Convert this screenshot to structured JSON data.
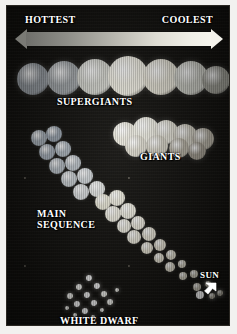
{
  "figure": {
    "title_alt": "Hertzsprung-Russell diagram",
    "background_color": "#13120f",
    "frame_color": "#f2f1ef"
  },
  "axis": {
    "left_label": "HOTTEST",
    "right_label": "COOLEST",
    "arrow": {
      "name": "temperature-gradient-arrow",
      "direction": "double",
      "gradient_from": "#6f6f6b",
      "gradient_to": "#f6f5ee"
    }
  },
  "regions": [
    {
      "key": "supergiants",
      "label": "SUPERGIANTS"
    },
    {
      "key": "giants",
      "label": "GIANTS"
    },
    {
      "key": "main_sequence",
      "label": "MAIN\nSEQUENCE"
    },
    {
      "key": "main_sequence_l1",
      "label": "MAIN"
    },
    {
      "key": "main_sequence_l2",
      "label": "SEQUENCE"
    },
    {
      "key": "sun",
      "label": "SUN"
    },
    {
      "key": "white_dwarf",
      "label": "WHITE DWARF"
    }
  ],
  "labels": {
    "hottest": "HOTTEST",
    "coolest": "COOLEST",
    "supergiants": "SUPERGIANTS",
    "giants": "GIANTS",
    "main_sequence_line1": "MAIN",
    "main_sequence_line2": "SEQUENCE",
    "sun": "SUN",
    "white_dwarf": "WHITE DWARF"
  },
  "chart_data": {
    "type": "scatter",
    "xlabel": "Temperature (HOTTEST to COOLEST)",
    "ylabel": "Luminosity (brightest at top)",
    "xlim_labels": [
      "HOTTEST",
      "COOLEST"
    ],
    "grid": false,
    "legend": "none",
    "annotations": [
      "HOTTEST",
      "COOLEST",
      "SUPERGIANTS",
      "GIANTS",
      "MAIN SEQUENCE",
      "SUN",
      "WHITE DWARF"
    ],
    "groups": [
      {
        "name": "SUPERGIANTS",
        "note": "horizontal band of very large stars across the top",
        "stars": [
          {
            "x": 26,
            "y": 73,
            "r": 16,
            "color": "#9aa0a6"
          },
          {
            "x": 57,
            "y": 72,
            "r": 17,
            "color": "#a8adb0"
          },
          {
            "x": 88,
            "y": 71,
            "r": 18,
            "color": "#d8d9d2"
          },
          {
            "x": 121,
            "y": 70,
            "r": 20,
            "color": "#f1efe4"
          },
          {
            "x": 154,
            "y": 71,
            "r": 18,
            "color": "#e6e3d6"
          },
          {
            "x": 184,
            "y": 72,
            "r": 17,
            "color": "#cfd0c8"
          },
          {
            "x": 209,
            "y": 74,
            "r": 14,
            "color": "#a5a59c"
          }
        ]
      },
      {
        "name": "GIANTS",
        "note": "cluster of medium-large stars, right of centre",
        "stars": [
          {
            "x": 118,
            "y": 128,
            "r": 12,
            "color": "#e9e7dc"
          },
          {
            "x": 139,
            "y": 124,
            "r": 13,
            "color": "#efeee3"
          },
          {
            "x": 159,
            "y": 126,
            "r": 12,
            "color": "#e2e0d4"
          },
          {
            "x": 178,
            "y": 130,
            "r": 12,
            "color": "#cfccbf"
          },
          {
            "x": 196,
            "y": 133,
            "r": 11,
            "color": "#b8b3a6"
          },
          {
            "x": 129,
            "y": 140,
            "r": 11,
            "color": "#dcd9cd"
          },
          {
            "x": 150,
            "y": 140,
            "r": 11,
            "color": "#d4d1c4"
          },
          {
            "x": 172,
            "y": 142,
            "r": 10,
            "color": "#b9b4a6"
          },
          {
            "x": 190,
            "y": 145,
            "r": 9,
            "color": "#a49e92"
          }
        ]
      },
      {
        "name": "MAIN SEQUENCE",
        "note": "diagonal band from upper-left (hot, bright) to lower-right (cool, faint)",
        "stars": [
          {
            "x": 32,
            "y": 132,
            "r": 8,
            "color": "#a9b2bb"
          },
          {
            "x": 47,
            "y": 128,
            "r": 8,
            "color": "#9fa9b4"
          },
          {
            "x": 40,
            "y": 146,
            "r": 8,
            "color": "#aab3bd"
          },
          {
            "x": 56,
            "y": 143,
            "r": 8,
            "color": "#b3bcc4"
          },
          {
            "x": 50,
            "y": 160,
            "r": 8,
            "color": "#b9c1c8"
          },
          {
            "x": 66,
            "y": 157,
            "r": 8,
            "color": "#c2c9cf"
          },
          {
            "x": 62,
            "y": 173,
            "r": 8,
            "color": "#cdd3d7"
          },
          {
            "x": 78,
            "y": 170,
            "r": 8,
            "color": "#d5dadd"
          },
          {
            "x": 74,
            "y": 186,
            "r": 8,
            "color": "#dfe2e3"
          },
          {
            "x": 90,
            "y": 183,
            "r": 8,
            "color": "#e6e8e6"
          },
          {
            "x": 96,
            "y": 196,
            "r": 8,
            "color": "#eceada"
          },
          {
            "x": 110,
            "y": 192,
            "r": 8,
            "color": "#f0eee1"
          },
          {
            "x": 106,
            "y": 208,
            "r": 8,
            "color": "#f1efe3"
          },
          {
            "x": 121,
            "y": 205,
            "r": 8,
            "color": "#f2f0e4"
          },
          {
            "x": 117,
            "y": 220,
            "r": 7,
            "color": "#f0eee2"
          },
          {
            "x": 131,
            "y": 217,
            "r": 7,
            "color": "#efece0"
          },
          {
            "x": 127,
            "y": 231,
            "r": 7,
            "color": "#ece9dc"
          },
          {
            "x": 142,
            "y": 228,
            "r": 7,
            "color": "#e9e5d7"
          },
          {
            "x": 140,
            "y": 242,
            "r": 6,
            "color": "#e6e2d3"
          },
          {
            "x": 153,
            "y": 239,
            "r": 6,
            "color": "#e3dfd0"
          },
          {
            "x": 152,
            "y": 252,
            "r": 5,
            "color": "#e0dccd"
          },
          {
            "x": 164,
            "y": 249,
            "r": 5,
            "color": "#dcd8c9"
          },
          {
            "x": 163,
            "y": 261,
            "r": 5,
            "color": "#d9d5c6"
          },
          {
            "x": 175,
            "y": 258,
            "r": 4,
            "color": "#d4d0c1"
          },
          {
            "x": 176,
            "y": 270,
            "r": 4,
            "color": "#d0ccbd"
          },
          {
            "x": 187,
            "y": 268,
            "r": 4,
            "color": "#cbc7b8"
          },
          {
            "x": 190,
            "y": 281,
            "r": 4,
            "color": "#c6c2b3"
          },
          {
            "x": 201,
            "y": 278,
            "r": 3,
            "color": "#c1bdae"
          },
          {
            "x": 205,
            "y": 290,
            "r": 3,
            "color": "#bcb8a9"
          },
          {
            "x": 213,
            "y": 287,
            "r": 3,
            "color": "#b7b3a4"
          }
        ]
      },
      {
        "name": "SUN",
        "note": "single star on the main sequence marked with an arrow",
        "stars": [
          {
            "x": 193,
            "y": 289,
            "r": 4,
            "color": "#ffffff"
          }
        ]
      },
      {
        "name": "WHITE DWARF",
        "note": "cluster of small very bright points at the lower left",
        "stars": [
          {
            "x": 82,
            "y": 272,
            "r": 3,
            "color": "#ffffff"
          },
          {
            "x": 72,
            "y": 281,
            "r": 3,
            "color": "#fbfbf6"
          },
          {
            "x": 90,
            "y": 280,
            "r": 3,
            "color": "#ffffff"
          },
          {
            "x": 63,
            "y": 290,
            "r": 3,
            "color": "#f7f7f1"
          },
          {
            "x": 80,
            "y": 289,
            "r": 3,
            "color": "#ffffff"
          },
          {
            "x": 97,
            "y": 288,
            "r": 3,
            "color": "#fafaf4"
          },
          {
            "x": 70,
            "y": 298,
            "r": 3,
            "color": "#ffffff"
          },
          {
            "x": 87,
            "y": 297,
            "r": 3,
            "color": "#ffffff"
          },
          {
            "x": 103,
            "y": 296,
            "r": 3,
            "color": "#f4f4ee"
          },
          {
            "x": 60,
            "y": 302,
            "r": 2,
            "color": "#eeeee8"
          },
          {
            "x": 78,
            "y": 305,
            "r": 3,
            "color": "#ffffff"
          },
          {
            "x": 95,
            "y": 304,
            "r": 2,
            "color": "#f6f6f0"
          },
          {
            "x": 68,
            "y": 309,
            "r": 2,
            "color": "#ededE6"
          },
          {
            "x": 86,
            "y": 311,
            "r": 2,
            "color": "#f2f2ec"
          },
          {
            "x": 110,
            "y": 284,
            "r": 2,
            "color": "#e9e9e2"
          }
        ]
      }
    ]
  },
  "pointer": {
    "name": "sun-pointer-arrow",
    "color": "#ffffff",
    "direction": "down-left"
  }
}
